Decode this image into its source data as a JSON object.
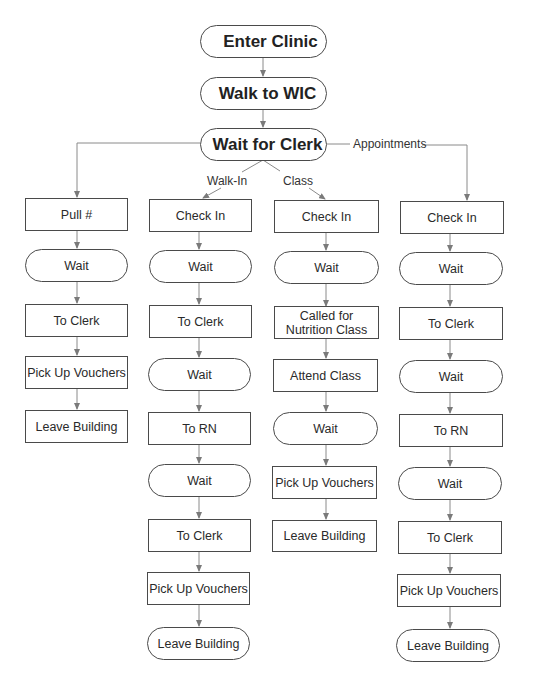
{
  "diagram": {
    "type": "flowchart",
    "top": [
      {
        "label": "Enter Clinic",
        "shape": "terminal"
      },
      {
        "label": "Walk to WIC",
        "shape": "terminal"
      },
      {
        "label": "Wait for Clerk",
        "shape": "terminal"
      }
    ],
    "branch_labels": {
      "walk_in": "Walk-In",
      "class": "Class",
      "appointments": "Appointments"
    },
    "columns": [
      {
        "name": "pull-number",
        "steps": [
          {
            "label": "Pull #",
            "shape": "rect"
          },
          {
            "label": "Wait",
            "shape": "terminal"
          },
          {
            "label": "To Clerk",
            "shape": "rect"
          },
          {
            "label": "Pick Up Vouchers",
            "shape": "rect"
          },
          {
            "label": "Leave Building",
            "shape": "rect"
          }
        ]
      },
      {
        "name": "walk-in",
        "steps": [
          {
            "label": "Check In",
            "shape": "rect"
          },
          {
            "label": "Wait",
            "shape": "terminal"
          },
          {
            "label": "To Clerk",
            "shape": "rect"
          },
          {
            "label": "Wait",
            "shape": "terminal"
          },
          {
            "label": "To RN",
            "shape": "rect"
          },
          {
            "label": "Wait",
            "shape": "terminal"
          },
          {
            "label": "To Clerk",
            "shape": "rect"
          },
          {
            "label": "Pick Up Vouchers",
            "shape": "rect"
          },
          {
            "label": "Leave Building",
            "shape": "terminal"
          }
        ]
      },
      {
        "name": "class",
        "steps": [
          {
            "label": "Check In",
            "shape": "rect"
          },
          {
            "label": "Wait",
            "shape": "terminal"
          },
          {
            "label": "Called for Nutrition Class",
            "shape": "rect"
          },
          {
            "label": "Attend Class",
            "shape": "rect"
          },
          {
            "label": "Wait",
            "shape": "terminal"
          },
          {
            "label": "Pick Up Vouchers",
            "shape": "rect"
          },
          {
            "label": "Leave Building",
            "shape": "rect"
          }
        ]
      },
      {
        "name": "appointments",
        "steps": [
          {
            "label": "Check In",
            "shape": "rect"
          },
          {
            "label": "Wait",
            "shape": "terminal"
          },
          {
            "label": "To Clerk",
            "shape": "rect"
          },
          {
            "label": "Wait",
            "shape": "terminal"
          },
          {
            "label": "To RN",
            "shape": "rect"
          },
          {
            "label": "Wait",
            "shape": "terminal"
          },
          {
            "label": "To Clerk",
            "shape": "rect"
          },
          {
            "label": "Pick Up Vouchers",
            "shape": "rect"
          },
          {
            "label": "Leave Building",
            "shape": "terminal"
          }
        ]
      }
    ],
    "colors": {
      "line": "#7a7a7a",
      "border": "#4a4a4a",
      "text": "#2a2a2a"
    }
  }
}
